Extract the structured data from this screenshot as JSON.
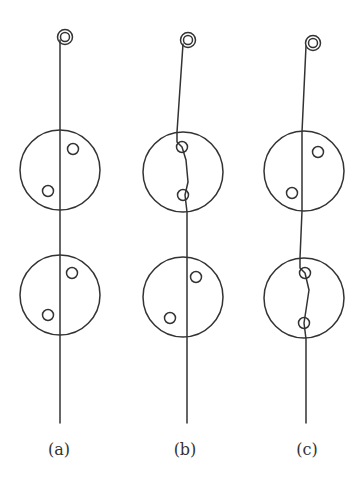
{
  "figure": {
    "colors": {
      "stroke": "#333333",
      "background": "#ffffff"
    },
    "panels": [
      {
        "id": "a",
        "label": "(a)",
        "label_x": 59,
        "ring": {
          "cx": 65,
          "cy": 37
        },
        "thread_points": "60,40 60,423",
        "disks": [
          {
            "cx": 60,
            "cy": 170,
            "r": 40,
            "holes": [
              {
                "cx": 73,
                "cy": 149
              },
              {
                "cx": 48,
                "cy": 191
              }
            ]
          },
          {
            "cx": 60,
            "cy": 295,
            "r": 40,
            "holes": [
              {
                "cx": 72,
                "cy": 273
              },
              {
                "cx": 48,
                "cy": 315
              }
            ]
          }
        ],
        "state": "thread straight through both disks"
      },
      {
        "id": "b",
        "label": "(b)",
        "label_x": 185,
        "ring": {
          "cx": 188,
          "cy": 40
        },
        "thread_points": "183,44 177,132 177,142 182,147 186,160 188,182 185,195 187,212 187,423",
        "disks": [
          {
            "cx": 183,
            "cy": 172,
            "r": 40,
            "holes": [
              {
                "cx": 182,
                "cy": 147
              },
              {
                "cx": 183,
                "cy": 195
              }
            ]
          },
          {
            "cx": 183,
            "cy": 297,
            "r": 40,
            "holes": [
              {
                "cx": 196,
                "cy": 277
              },
              {
                "cx": 170,
                "cy": 318
              }
            ]
          }
        ],
        "state": "thread passes through holes of upper disk"
      },
      {
        "id": "c",
        "label": "(c)",
        "label_x": 307,
        "ring": {
          "cx": 313,
          "cy": 43
        },
        "thread_points": "306,46 302,132 302,211 300,258 300,268 305,273 309,290 306,310 304,323 306,339 306,423",
        "disks": [
          {
            "cx": 304,
            "cy": 171,
            "r": 40,
            "holes": [
              {
                "cx": 318,
                "cy": 152
              },
              {
                "cx": 292,
                "cy": 193
              }
            ]
          },
          {
            "cx": 304,
            "cy": 298,
            "r": 40,
            "holes": [
              {
                "cx": 305,
                "cy": 273
              },
              {
                "cx": 304,
                "cy": 323
              }
            ]
          }
        ],
        "state": "thread passes through holes of lower disk"
      }
    ]
  }
}
